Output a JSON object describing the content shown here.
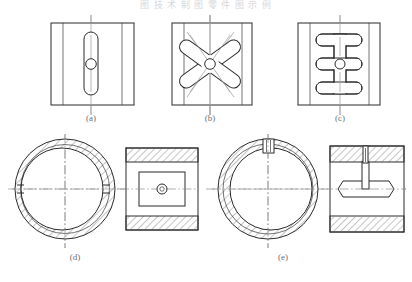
{
  "page": {
    "header_text": "图 技 术 制 图 零 件 图 示 例",
    "background_color": "#ffffff",
    "line_color": "#2b2b2b",
    "centerline_color": "#8e8e94",
    "caption_color": "#6f6f74",
    "width": 412,
    "height": 282
  },
  "figures": [
    {
      "id": "a",
      "caption": "(a)",
      "description": "Square block front view with single vertical straight slot and central bore",
      "view_type": "front-view",
      "features": [
        "square-outline",
        "left-edge-strip",
        "right-edge-strip",
        "vertical-oblong-slot",
        "center-bore-circle",
        "vertical-centerline"
      ]
    },
    {
      "id": "b",
      "caption": "(b)",
      "description": "Square block front view with crossed X-shaped slots and central bore",
      "view_type": "front-view",
      "features": [
        "square-outline",
        "left-edge-strip",
        "right-edge-strip",
        "diagonal-oblong-slot-1",
        "diagonal-oblong-slot-2",
        "center-bore-circle",
        "vertical-centerline",
        "diagonal-centerlines"
      ]
    },
    {
      "id": "c",
      "caption": "(c)",
      "description": "Square block front view with three horizontal slots joined by a vertical spine and central bore",
      "view_type": "front-view",
      "features": [
        "square-outline",
        "left-edge-strip",
        "right-edge-strip",
        "upper-horizontal-slot",
        "middle-horizontal-slot",
        "lower-horizontal-slot",
        "vertical-spine-slot",
        "center-bore-circle",
        "vertical-centerline"
      ]
    },
    {
      "id": "d",
      "caption": "(d)",
      "description": "Bushing shown as sectioned end view plus sectioned side view with rectangular recess",
      "view_type": "section-pair",
      "features": [
        "outer-circle",
        "inner-bore-circle",
        "hatched-annulus",
        "horizontal-centerline",
        "vertical-centerline",
        "side-view-outline",
        "hatched-top-band",
        "hatched-bottom-band",
        "inner-rectangle-recess",
        "center-bore-circle"
      ]
    },
    {
      "id": "e",
      "caption": "(e)",
      "description": "Bushing shown as sectioned end view with keyway plus sectioned side view with pin and elongated slot",
      "view_type": "section-pair",
      "features": [
        "outer-circle",
        "inner-bore-circle",
        "hatched-annulus",
        "keyway-slot",
        "horizontal-centerline",
        "vertical-centerline",
        "side-view-outline",
        "hatched-top-band",
        "hatched-bottom-band",
        "vertical-pin",
        "horizontal-oblong-slot"
      ]
    }
  ],
  "captions": {
    "a": "(a)",
    "b": "(b)",
    "c": "(c)",
    "d": "(d)",
    "e": "(e)"
  }
}
